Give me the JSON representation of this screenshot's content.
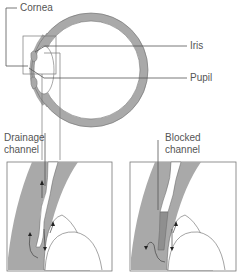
{
  "diagram": {
    "type": "anatomy-illustration",
    "labels": {
      "cornea": "Cornea",
      "iris": "Iris",
      "pupil": "Pupil",
      "drainage_line1": "Drainage",
      "drainage_line2": "channel",
      "blocked_line1": "Blocked",
      "blocked_line2": "channel"
    },
    "panels": [
      {
        "name": "eye-cross-section"
      },
      {
        "name": "drainage-detail-normal",
        "caption": "Drainage channel"
      },
      {
        "name": "drainage-detail-blocked",
        "caption": "Blocked channel"
      }
    ],
    "colors": {
      "tissue": "#a9a9a9",
      "line": "#555555",
      "background": "#ffffff",
      "blockage": "#8f8f8f"
    }
  }
}
